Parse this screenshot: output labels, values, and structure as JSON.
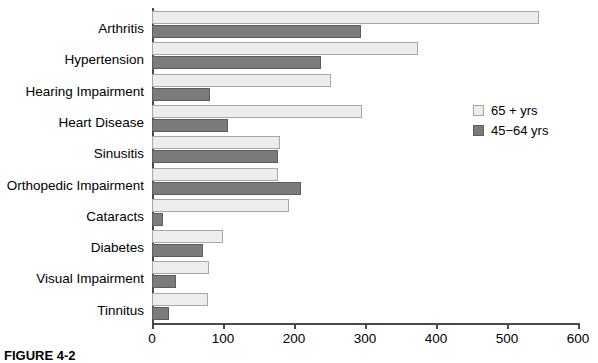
{
  "chart_data": {
    "type": "bar",
    "orientation": "horizontal",
    "title": "",
    "xlabel": "",
    "ylabel": "",
    "xlim": [
      0,
      600
    ],
    "xticks": [
      0,
      100,
      200,
      300,
      400,
      500,
      600
    ],
    "grid": false,
    "legend_position": "right",
    "categories": [
      "Arthritis",
      "Hypertension",
      "Hearing Impairment",
      "Heart Disease",
      "Sinusitis",
      "Orthopedic Impairment",
      "Cataracts",
      "Diabetes",
      "Visual Impairment",
      "Tinnitus"
    ],
    "series": [
      {
        "name": "65 + yrs",
        "color": "#ededed",
        "values": [
          545,
          375,
          252,
          296,
          180,
          178,
          193,
          100,
          80,
          79
        ]
      },
      {
        "name": "45−64 yrs",
        "color": "#7b7b7b",
        "values": [
          294,
          238,
          82,
          107,
          178,
          210,
          15,
          72,
          34,
          24
        ]
      }
    ]
  },
  "legend": {
    "entries": [
      {
        "label": "65 + yrs",
        "swatch": "light"
      },
      {
        "label": "45−64 yrs",
        "swatch": "dark"
      }
    ]
  },
  "caption": {
    "text": "FIGURE 4-2"
  },
  "colors": {
    "light_bar": "#ededed",
    "dark_bar": "#7b7b7b",
    "axis": "#4a4a4a"
  }
}
